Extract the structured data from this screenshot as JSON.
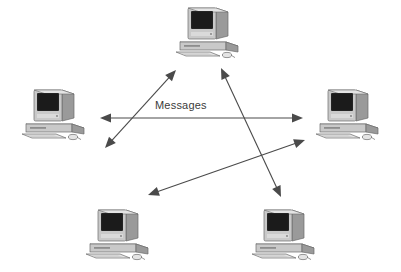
{
  "diagram": {
    "title": "Messages",
    "background_color": "#ffffff",
    "line_color": "#4a4a4a",
    "label": {
      "text": "Messages",
      "color": "#3b3b3b"
    },
    "node_colors": {
      "case_light": "#e4e4e4",
      "case_mid": "#c9c9c9",
      "case_dark": "#9a9a9a",
      "case_shadow": "#7e7e7e",
      "screen": "#242424",
      "outline": "#6b6b6b"
    },
    "nodes": [
      {
        "id": "top",
        "name": "computer-top",
        "x": 170,
        "y": 2,
        "label": "Computer"
      },
      {
        "id": "left",
        "name": "computer-left",
        "x": 16,
        "y": 84,
        "label": "Computer"
      },
      {
        "id": "right",
        "name": "computer-right",
        "x": 310,
        "y": 84,
        "label": "Computer"
      },
      {
        "id": "bottom-left",
        "name": "computer-bottom-left",
        "x": 80,
        "y": 204,
        "label": "Computer"
      },
      {
        "id": "bottom-right",
        "name": "computer-bottom-right",
        "x": 246,
        "y": 204,
        "label": "Computer"
      }
    ],
    "connections": [
      {
        "id": "left-top",
        "name": "arrow-left-to-top",
        "from": "left",
        "to": "top",
        "x1": 105,
        "y1": 148,
        "x2": 176,
        "y2": 70,
        "double_headed": true
      },
      {
        "id": "left-right",
        "name": "arrow-left-to-right",
        "from": "left",
        "to": "right",
        "x1": 100,
        "y1": 118,
        "x2": 303,
        "y2": 118,
        "double_headed": true,
        "label": "Messages"
      },
      {
        "id": "top-bottom-right",
        "name": "arrow-top-to-bottom-right",
        "from": "top",
        "to": "bottom-right",
        "x1": 221,
        "y1": 68,
        "x2": 281,
        "y2": 197,
        "double_headed": true
      },
      {
        "id": "right-bottom-left",
        "name": "arrow-right-to-bottom-left",
        "from": "right",
        "to": "bottom-left",
        "x1": 305,
        "y1": 140,
        "x2": 148,
        "y2": 195,
        "double_headed": true
      }
    ]
  }
}
